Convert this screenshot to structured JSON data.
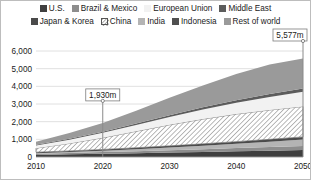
{
  "legend": {
    "rows": [
      [
        {
          "label": "U.S.",
          "color": "#3f3f3f",
          "pattern": "solid",
          "swatch_name": "legend-swatch-us"
        },
        {
          "label": "Brazil & Mexico",
          "color": "#8d8d8d",
          "pattern": "solid",
          "swatch_name": "legend-swatch-brazil-mexico"
        },
        {
          "label": "European Union",
          "color": "#f2f2f2",
          "pattern": "solid",
          "swatch_name": "legend-swatch-european-union"
        },
        {
          "label": "Middle East",
          "color": "#5c5c5c",
          "pattern": "solid",
          "swatch_name": "legend-swatch-middle-east"
        }
      ],
      [
        {
          "label": "Japan & Korea",
          "color": "#4a4a4a",
          "pattern": "solid",
          "swatch_name": "legend-swatch-japan-korea"
        },
        {
          "label": "China",
          "color": "#ffffff",
          "pattern": "hatch",
          "swatch_name": "legend-swatch-china"
        },
        {
          "label": "India",
          "color": "#b4b4b4",
          "pattern": "solid",
          "swatch_name": "legend-swatch-india"
        },
        {
          "label": "Indonesia",
          "color": "#4f4f4f",
          "pattern": "solid",
          "swatch_name": "legend-swatch-indonesia"
        },
        {
          "label": "Rest of world",
          "color": "#9a9a9a",
          "pattern": "solid",
          "swatch_name": "legend-swatch-rest-of-world"
        }
      ]
    ]
  },
  "axes": {
    "y_ticks": [
      "0",
      "1,000",
      "2,000",
      "3,000",
      "4,000",
      "5,000",
      "6,000"
    ],
    "x_ticks": [
      "2010",
      "2020",
      "2030",
      "2040",
      "2050"
    ]
  },
  "callouts": [
    {
      "label": "1,930m",
      "year": 2020,
      "value": 1930,
      "name": "callout-2020"
    },
    {
      "label": "5,577m",
      "year": 2050,
      "value": 5577,
      "name": "callout-2050"
    }
  ],
  "chart_data": {
    "type": "area",
    "stacked": true,
    "title": "",
    "subtitle": "",
    "xlabel": "",
    "ylabel": "",
    "xlim": [
      2010,
      2050
    ],
    "ylim": [
      0,
      6000
    ],
    "grid": true,
    "legend_position": "top",
    "x": [
      2010,
      2015,
      2020,
      2025,
      2030,
      2035,
      2040,
      2045,
      2050
    ],
    "series": [
      {
        "name": "U.S.",
        "color": "#3f3f3f",
        "pattern": "solid",
        "values": [
          120,
          150,
          180,
          215,
          250,
          285,
          320,
          355,
          390
        ]
      },
      {
        "name": "Brazil & Mexico",
        "color": "#8d8d8d",
        "pattern": "solid",
        "values": [
          60,
          78,
          96,
          116,
          138,
          160,
          184,
          208,
          234
        ]
      },
      {
        "name": "India",
        "color": "#b4b4b4",
        "pattern": "solid",
        "values": [
          35,
          55,
          80,
          112,
          150,
          195,
          245,
          300,
          360
        ]
      },
      {
        "name": "Japan & Korea",
        "color": "#4a4a4a",
        "pattern": "solid",
        "values": [
          55,
          62,
          70,
          80,
          92,
          105,
          120,
          136,
          154
        ]
      },
      {
        "name": "China",
        "color": "#ffffff",
        "pattern": "hatch",
        "values": [
          230,
          420,
          660,
          930,
          1190,
          1400,
          1560,
          1660,
          1720
        ]
      },
      {
        "name": "European Union",
        "color": "#f2f2f2",
        "pattern": "solid",
        "values": [
          150,
          210,
          280,
          360,
          450,
          545,
          640,
          735,
          830
        ]
      },
      {
        "name": "Middle East",
        "color": "#5c5c5c",
        "pattern": "solid",
        "values": [
          40,
          52,
          66,
          82,
          100,
          120,
          142,
          166,
          192
        ]
      },
      {
        "name": "Rest of world",
        "color": "#9a9a9a",
        "pattern": "solid",
        "values": [
          180,
          330,
          498,
          720,
          980,
          1240,
          1490,
          1670,
          1697
        ]
      }
    ],
    "totals": [
      870,
      1357,
      1930,
      2615,
      3350,
      4050,
      4701,
      5230,
      5577
    ],
    "annotations": [
      {
        "text": "1,930m",
        "x": 2020,
        "y": 1930
      },
      {
        "text": "5,577m",
        "x": 2050,
        "y": 5577
      }
    ]
  }
}
